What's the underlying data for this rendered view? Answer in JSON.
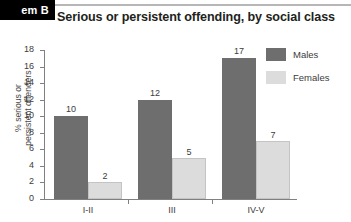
{
  "corner_tab": {
    "label": "em B"
  },
  "chart_data": {
    "type": "bar",
    "title": "Serious or persistent offending, by social class",
    "xlabel": "",
    "ylabel": "% serious or persistent offenders",
    "ylabel_lines": [
      "% serious or",
      "persistent offenders"
    ],
    "categories": [
      "I-II",
      "III",
      "IV-V"
    ],
    "series": [
      {
        "name": "Males",
        "color": "#6e6e6e",
        "values": [
          10,
          12,
          17
        ]
      },
      {
        "name": "Females",
        "color": "#dcdcdc",
        "values": [
          2,
          5,
          7
        ]
      }
    ],
    "ylim": [
      0,
      18
    ],
    "ytick_step": 2,
    "yticks": [
      0,
      2,
      4,
      6,
      8,
      10,
      12,
      14,
      16,
      18
    ],
    "grid": false,
    "legend_position": "right"
  },
  "legend": {
    "entries": [
      {
        "label": "Males",
        "color": "#6e6e6e"
      },
      {
        "label": "Females",
        "color": "#dcdcdc"
      }
    ]
  }
}
